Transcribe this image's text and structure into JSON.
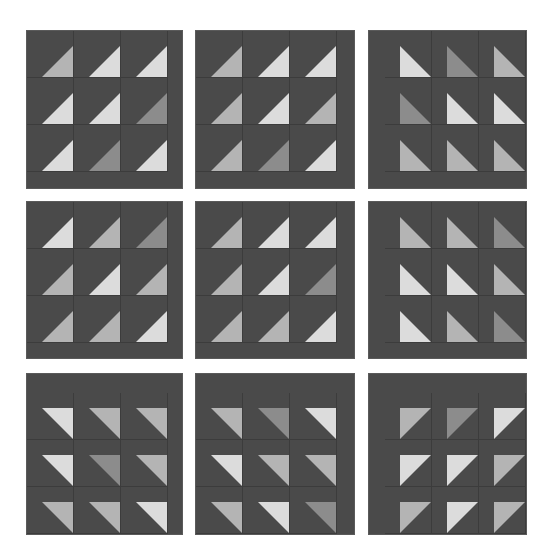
{
  "puzzle": {
    "colors": {
      "background": "#ffffff",
      "panel": "#4a4a4a",
      "L": "#dcdcdc",
      "M": "#b4b4b4",
      "D": "#8c8c8c"
    },
    "panels": [
      {
        "id": 1,
        "x": 27,
        "y": 31,
        "w": 155,
        "h": 157,
        "margin": "bottom",
        "corner": "BR",
        "shades": [
          [
            "M",
            "L",
            "L"
          ],
          [
            "L",
            "L",
            "D"
          ],
          [
            "L",
            "D",
            "L"
          ]
        ]
      },
      {
        "id": 2,
        "x": 196,
        "y": 31,
        "w": 158,
        "h": 157,
        "margin": "bottom",
        "corner": "BR",
        "shades": [
          [
            "M",
            "L",
            "L"
          ],
          [
            "M",
            "L",
            "M"
          ],
          [
            "M",
            "D",
            "L"
          ]
        ]
      },
      {
        "id": 3,
        "x": 369,
        "y": 31,
        "w": 157,
        "h": 157,
        "margin": "left",
        "corner": "BL",
        "shades": [
          [
            "L",
            "D",
            "M"
          ],
          [
            "D",
            "L",
            "L"
          ],
          [
            "M",
            "M",
            "M"
          ]
        ]
      },
      {
        "id": 4,
        "x": 27,
        "y": 202,
        "w": 155,
        "h": 156,
        "margin": "bottom",
        "corner": "BR",
        "shades": [
          [
            "L",
            "M",
            "D"
          ],
          [
            "M",
            "L",
            "M"
          ],
          [
            "M",
            "M",
            "L"
          ]
        ]
      },
      {
        "id": 5,
        "x": 196,
        "y": 202,
        "w": 158,
        "h": 156,
        "margin": "bottom",
        "corner": "BR",
        "shades": [
          [
            "M",
            "L",
            "L"
          ],
          [
            "M",
            "L",
            "D"
          ],
          [
            "M",
            "M",
            "L"
          ]
        ]
      },
      {
        "id": 6,
        "x": 369,
        "y": 202,
        "w": 157,
        "h": 156,
        "margin": "left",
        "corner": "BL",
        "shades": [
          [
            "M",
            "M",
            "D"
          ],
          [
            "L",
            "L",
            "M"
          ],
          [
            "L",
            "M",
            "D"
          ]
        ]
      },
      {
        "id": 7,
        "x": 27,
        "y": 374,
        "w": 155,
        "h": 160,
        "margin": "top",
        "corner": "TR",
        "shades": [
          [
            "L",
            "M",
            "M"
          ],
          [
            "L",
            "D",
            "M"
          ],
          [
            "M",
            "M",
            "L"
          ]
        ]
      },
      {
        "id": 8,
        "x": 196,
        "y": 374,
        "w": 158,
        "h": 160,
        "margin": "top",
        "corner": "TR",
        "shades": [
          [
            "M",
            "D",
            "L"
          ],
          [
            "L",
            "M",
            "M"
          ],
          [
            "M",
            "L",
            "D"
          ]
        ]
      },
      {
        "id": 9,
        "x": 369,
        "y": 374,
        "w": 157,
        "h": 160,
        "margin": "topleft",
        "corner": "TL",
        "shades": [
          [
            "M",
            "D",
            "L"
          ],
          [
            "L",
            "L",
            "M"
          ],
          [
            "M",
            "L",
            "M"
          ]
        ]
      }
    ]
  }
}
